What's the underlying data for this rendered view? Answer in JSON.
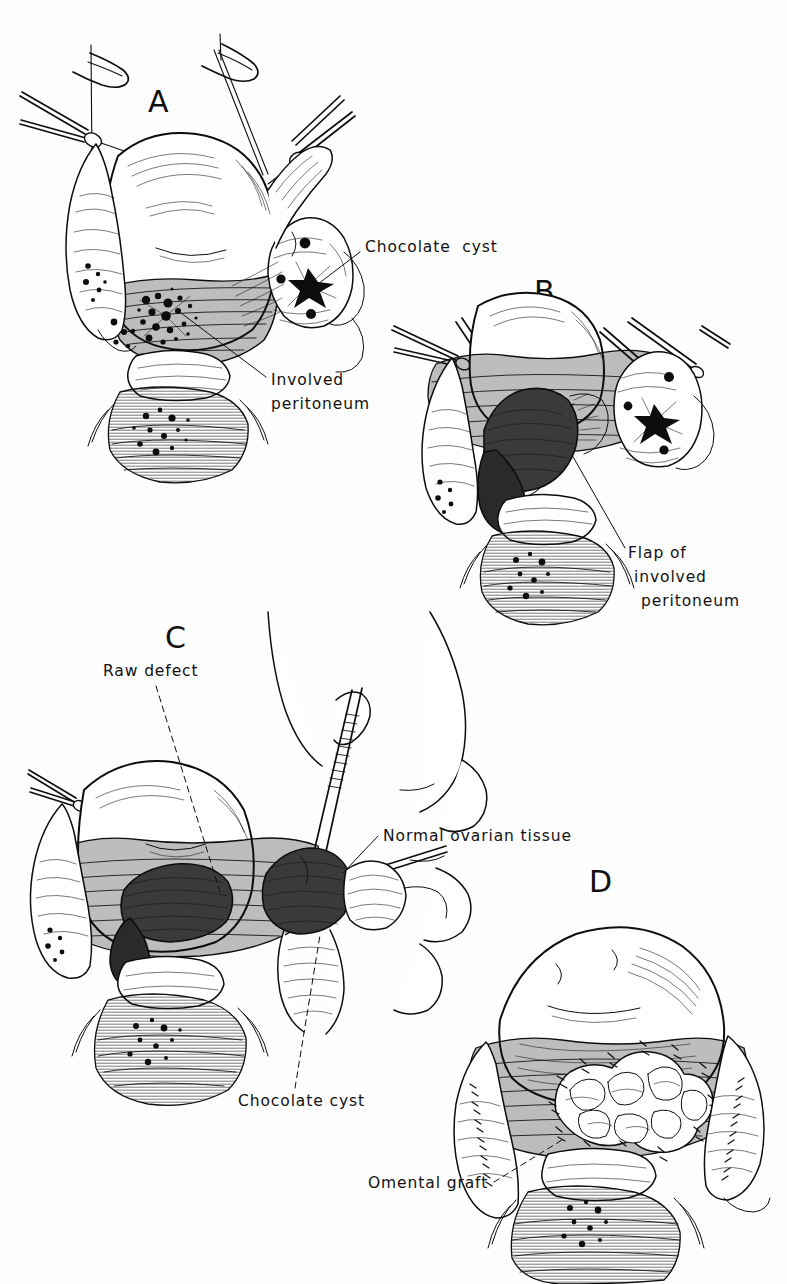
{
  "figure": {
    "kind": "medical-line-illustration",
    "title_visible": false,
    "background_color": "#fefefe",
    "ink_color": "#0d0d0d",
    "panel_count": 4
  },
  "panels": [
    {
      "id": "A",
      "letter": "A",
      "letter_pos": {
        "x": 148,
        "y": 112
      },
      "subject": "uterus-with-adnexa-and-endometriosis",
      "labels": [
        {
          "name": "chocolate-cyst",
          "text": "Chocolate  cyst",
          "x": 365,
          "y": 252,
          "anchor": "start",
          "leader": {
            "style": "solid",
            "x1": 360,
            "y1": 252,
            "x2": 297,
            "y2": 300
          }
        },
        {
          "name": "involved-peritoneum",
          "text": "Involved",
          "text2": "peritoneum",
          "x": 271,
          "y": 385,
          "y2": 409,
          "anchor": "start",
          "leader": {
            "style": "solid",
            "x1": 266,
            "y1": 377,
            "x2": 177,
            "y2": 310
          }
        }
      ]
    },
    {
      "id": "B",
      "letter": "B",
      "letter_pos": {
        "x": 534,
        "y": 302
      },
      "subject": "peritoneal-flap-raised-with-scissors",
      "labels": [
        {
          "name": "flap-of-involved-peritoneum",
          "text": "Flap of",
          "text2": "involved",
          "text3": "peritoneum",
          "x": 628,
          "y": 558,
          "x2": 634,
          "y2": 582,
          "x3": 641,
          "y3": 606,
          "anchor": "start",
          "leader": {
            "style": "solid",
            "x1": 625,
            "y1": 548,
            "x2": 572,
            "y2": 455
          }
        }
      ]
    },
    {
      "id": "C",
      "letter": "C",
      "letter_pos": {
        "x": 165,
        "y": 648
      },
      "subject": "raw-defect-and-cyst-excision-with-forceps",
      "labels": [
        {
          "name": "raw-defect",
          "text": "Raw defect",
          "x": 103,
          "y": 676,
          "anchor": "start",
          "leader": {
            "style": "dashed",
            "x1": 156,
            "y1": 686,
            "x2": 221,
            "y2": 895
          }
        },
        {
          "name": "normal-ovarian-tissue",
          "text": "Normal ovarian tissue",
          "x": 383,
          "y": 841,
          "anchor": "start",
          "leader": {
            "style": "solid",
            "x1": 378,
            "y1": 836,
            "x2": 343,
            "y2": 873
          }
        },
        {
          "name": "chocolate-cyst-c",
          "text": "Chocolate cyst",
          "x": 238,
          "y": 1106,
          "anchor": "start",
          "leader": {
            "style": "dashed",
            "x1": 295,
            "y1": 1088,
            "x2": 320,
            "y2": 935
          }
        }
      ]
    },
    {
      "id": "D",
      "letter": "D",
      "letter_pos": {
        "x": 589,
        "y": 892
      },
      "subject": "omental-graft-sutured-over-defect",
      "labels": [
        {
          "name": "omental-graft",
          "text": "Omental graft",
          "x": 368,
          "y": 1188,
          "anchor": "start",
          "leader": {
            "style": "dashed",
            "x1": 494,
            "y1": 1182,
            "x2": 562,
            "y2": 1140
          }
        }
      ]
    }
  ],
  "anatomy_notes": {
    "uterus": "central pear-shaped body, hatched lower segment",
    "ovaries": "bilateral, with dark punctate endometriotic implants",
    "instruments": [
      "suture-needle",
      "hemostat-clamp",
      "scissors",
      "tissue-forceps"
    ],
    "shading": "parallel-line hatching, stippled implants"
  }
}
